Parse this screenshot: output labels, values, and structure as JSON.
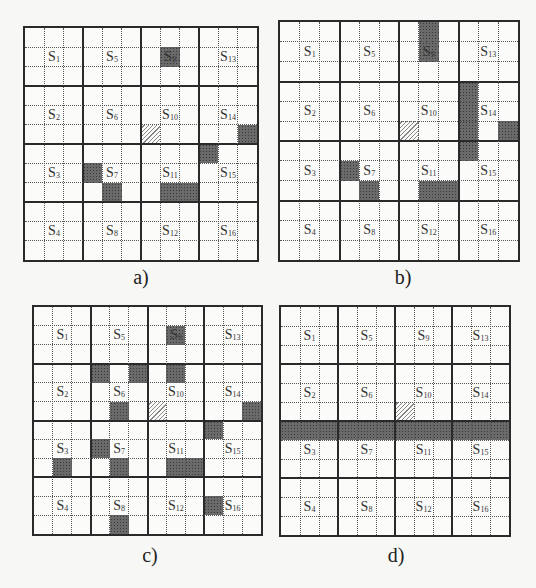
{
  "figure": {
    "grid_size": 12,
    "sectors_per_side": 4,
    "panels": [
      {
        "id": "a",
        "caption": "a)",
        "bounds": {
          "x": 23,
          "y": 26,
          "size": 236
        },
        "caption_pos": {
          "x": 141,
          "y": 266
        },
        "hatched": [
          [
            5,
            6
          ]
        ],
        "dark": [
          [
            1,
            7
          ],
          [
            5,
            11
          ],
          [
            6,
            9
          ],
          [
            7,
            3
          ],
          [
            8,
            4
          ],
          [
            8,
            7
          ],
          [
            8,
            8
          ]
        ]
      },
      {
        "id": "b",
        "caption": "b)",
        "bounds": {
          "x": 278,
          "y": 20,
          "size": 242
        },
        "caption_pos": {
          "x": 403,
          "y": 266
        },
        "hatched": [
          [
            5,
            6
          ]
        ],
        "dark": [
          [
            0,
            7
          ],
          [
            1,
            7
          ],
          [
            3,
            9
          ],
          [
            4,
            9
          ],
          [
            5,
            9
          ],
          [
            6,
            9
          ],
          [
            5,
            11
          ],
          [
            7,
            3
          ],
          [
            8,
            4
          ],
          [
            8,
            7
          ],
          [
            8,
            8
          ]
        ]
      },
      {
        "id": "c",
        "caption": "c)",
        "bounds": {
          "x": 32,
          "y": 305,
          "size": 231
        },
        "caption_pos": {
          "x": 150,
          "y": 544
        },
        "hatched": [
          [
            5,
            6
          ]
        ],
        "dark": [
          [
            1,
            7
          ],
          [
            3,
            3
          ],
          [
            3,
            5
          ],
          [
            3,
            7
          ],
          [
            5,
            4
          ],
          [
            5,
            11
          ],
          [
            6,
            9
          ],
          [
            7,
            3
          ],
          [
            8,
            1
          ],
          [
            8,
            4
          ],
          [
            8,
            7
          ],
          [
            8,
            8
          ],
          [
            10,
            9
          ],
          [
            11,
            4
          ]
        ]
      },
      {
        "id": "d",
        "caption": "d)",
        "bounds": {
          "x": 279,
          "y": 305,
          "size": 232
        },
        "caption_pos": {
          "x": 396,
          "y": 544
        },
        "hatched": [
          [
            5,
            6
          ]
        ],
        "dark": [
          [
            6,
            0
          ],
          [
            6,
            1
          ],
          [
            6,
            2
          ],
          [
            6,
            3
          ],
          [
            6,
            4
          ],
          [
            6,
            5
          ],
          [
            6,
            6
          ],
          [
            6,
            7
          ],
          [
            6,
            8
          ],
          [
            6,
            9
          ],
          [
            6,
            10
          ],
          [
            6,
            11
          ]
        ]
      }
    ],
    "sector_labels": [
      {
        "main": "S",
        "sub": "1",
        "sr": 0,
        "sc": 0
      },
      {
        "main": "S",
        "sub": "2",
        "sr": 1,
        "sc": 0
      },
      {
        "main": "S",
        "sub": "3",
        "sr": 2,
        "sc": 0
      },
      {
        "main": "S",
        "sub": "4",
        "sr": 3,
        "sc": 0
      },
      {
        "main": "S",
        "sub": "5",
        "sr": 0,
        "sc": 1
      },
      {
        "main": "S",
        "sub": "6",
        "sr": 1,
        "sc": 1
      },
      {
        "main": "S",
        "sub": "7",
        "sr": 2,
        "sc": 1
      },
      {
        "main": "S",
        "sub": "8",
        "sr": 3,
        "sc": 1
      },
      {
        "main": "S",
        "sub": "9",
        "sr": 0,
        "sc": 2
      },
      {
        "main": "S",
        "sub": "10",
        "sr": 1,
        "sc": 2
      },
      {
        "main": "S",
        "sub": "11",
        "sr": 2,
        "sc": 2
      },
      {
        "main": "S",
        "sub": "12",
        "sr": 3,
        "sc": 2
      },
      {
        "main": "S",
        "sub": "13",
        "sr": 0,
        "sc": 3
      },
      {
        "main": "S",
        "sub": "14",
        "sr": 1,
        "sc": 3
      },
      {
        "main": "S",
        "sub": "15",
        "sr": 2,
        "sc": 3
      },
      {
        "main": "S",
        "sub": "16",
        "sr": 3,
        "sc": 3
      }
    ]
  }
}
